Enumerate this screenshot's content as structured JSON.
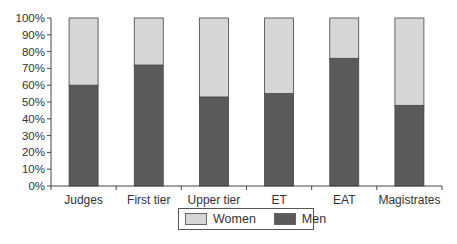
{
  "chart_data": {
    "type": "bar",
    "stacked": true,
    "percent": true,
    "title": "",
    "xlabel": "",
    "ylabel": "",
    "ylim": [
      0,
      100
    ],
    "yticks": [
      "0%",
      "10%",
      "20%",
      "30%",
      "40%",
      "50%",
      "60%",
      "70%",
      "80%",
      "90%",
      "100%"
    ],
    "categories": [
      "Judges",
      "First tier",
      "Upper tier",
      "ET",
      "EAT",
      "Magistrates"
    ],
    "series": [
      {
        "name": "Men",
        "color": "#5a5a5a",
        "values": [
          60,
          72,
          53,
          55,
          76,
          48
        ]
      },
      {
        "name": "Women",
        "color": "#d6d6d6",
        "values": [
          40,
          28,
          47,
          45,
          24,
          52
        ]
      }
    ],
    "legend": {
      "position": "bottom",
      "entries": [
        {
          "label": "Women",
          "color": "#d6d6d6"
        },
        {
          "label": "Men",
          "color": "#5a5a5a"
        }
      ]
    },
    "grid": false
  }
}
